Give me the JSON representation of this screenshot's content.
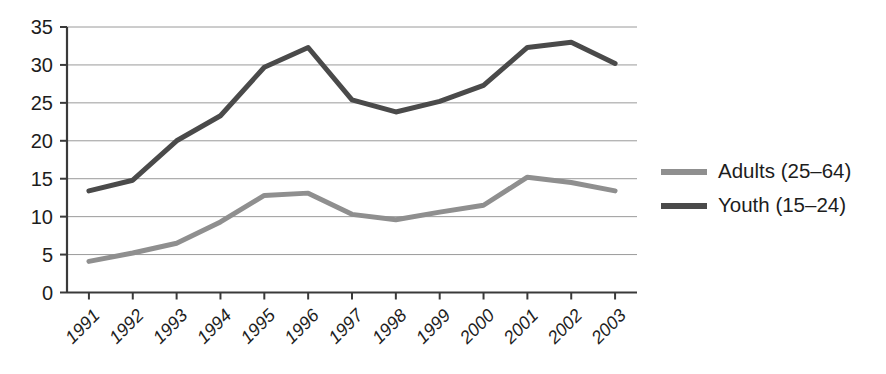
{
  "chart_data": {
    "type": "line",
    "title": "",
    "subtitle": "",
    "xlabel": "",
    "ylabel": "",
    "categories": [
      "1991",
      "1992",
      "1993",
      "1994",
      "1995",
      "1996",
      "1997",
      "1998",
      "1999",
      "2000",
      "2001",
      "2002",
      "2003"
    ],
    "series": [
      {
        "name": "Adults (25–64)",
        "color": "#8f8f8f",
        "values": [
          4.1,
          5.2,
          6.5,
          9.3,
          12.8,
          13.1,
          10.3,
          9.6,
          10.6,
          11.5,
          15.2,
          14.5,
          13.4
        ]
      },
      {
        "name": "Youth (15–24)",
        "color": "#4a4a4a",
        "values": [
          13.4,
          14.8,
          20.0,
          23.3,
          29.7,
          32.3,
          25.4,
          23.8,
          25.2,
          27.3,
          32.3,
          33.0,
          30.2
        ]
      }
    ],
    "ylim": [
      0,
      35
    ],
    "yticks": [
      0,
      5,
      10,
      15,
      20,
      25,
      30,
      35
    ],
    "ytick_labels": [
      "0",
      "5",
      "10",
      "15",
      "20",
      "25",
      "30",
      "35"
    ],
    "grid": true,
    "grid_axis": "y",
    "legend_position": "right",
    "xtick_rotation": -45
  },
  "legend": {
    "entries": [
      {
        "label": "Adults (25–64)",
        "color": "#8f8f8f"
      },
      {
        "label": "Youth (15–24)",
        "color": "#4a4a4a"
      }
    ]
  },
  "colors": {
    "adults": "#8f8f8f",
    "youth": "#4a4a4a",
    "grid": "#9a9a9a",
    "axis": "#3a3a3a",
    "text": "#1d1d1d",
    "background": "#ffffff"
  }
}
